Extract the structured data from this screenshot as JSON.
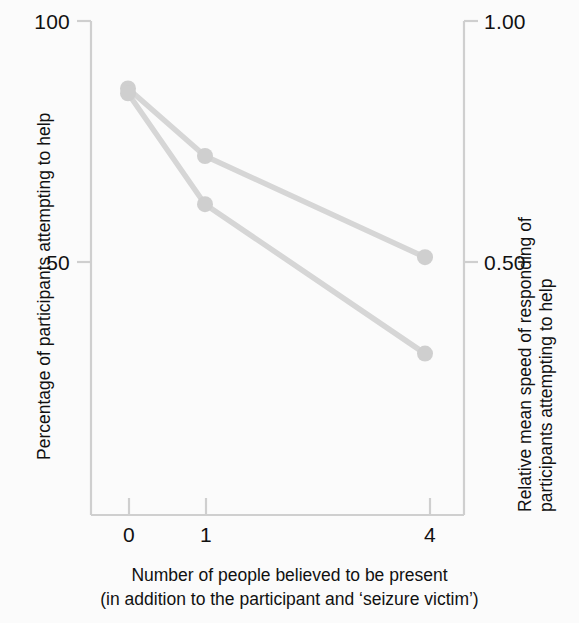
{
  "chart_data": {
    "type": "line",
    "title": "",
    "subtitle": "",
    "xlabel_lines": [
      "Number of people believed to be present",
      "(in addition to the participant and ‘seizure victim’)"
    ],
    "ylabel_left": "Percentage of participants attempting to help",
    "ylabel_right_lines": [
      "Relative mean speed of responding of",
      "participants attempting to help"
    ],
    "categories": [
      "0",
      "1",
      "4"
    ],
    "x_tick_labels": [
      "0",
      "1",
      "4"
    ],
    "y_left_tick_labels": [
      "100",
      "50"
    ],
    "y_right_tick_labels": [
      "1.00",
      "0.50"
    ],
    "ylim_left": [
      28,
      104
    ],
    "ylim_right": [
      0.28,
      1.04
    ],
    "y_left_ticks": [
      100,
      50
    ],
    "y_right_ticks": [
      1.0,
      0.5
    ],
    "grid": false,
    "legend": "none",
    "line_color": "#d6d6d6",
    "marker_color": "#cfcfcf",
    "axis_color": "#cfcfcf",
    "series": [
      {
        "name": "Relative mean speed of responding of participants attempting to help",
        "axis": "right",
        "values": [
          0.86,
          0.72,
          0.51
        ],
        "points": [
          {
            "x": "0",
            "value": 0.86
          },
          {
            "x": "1",
            "value": 0.72
          },
          {
            "x": "4",
            "value": 0.51
          }
        ]
      },
      {
        "name": "Percentage of participants attempting to help",
        "axis": "left",
        "values": [
          85,
          62,
          31
        ],
        "points": [
          {
            "x": "0",
            "value": 85
          },
          {
            "x": "1",
            "value": 62
          },
          {
            "x": "4",
            "value": 31
          }
        ]
      }
    ]
  },
  "axes": {
    "left_ticks": [
      {
        "label": "100"
      },
      {
        "label": "50"
      }
    ],
    "right_ticks": [
      {
        "label": "1.00"
      },
      {
        "label": "0.50"
      }
    ],
    "x_ticks": [
      {
        "label": "0"
      },
      {
        "label": "1"
      },
      {
        "label": "4"
      }
    ]
  }
}
